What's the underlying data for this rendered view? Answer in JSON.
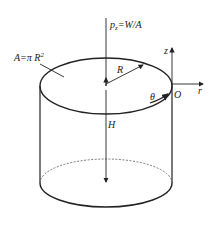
{
  "diagram": {
    "type": "cylinder-pressure",
    "labels": {
      "pressure": "p",
      "pressure_sub": "z",
      "pressure_rhs": "=W/A",
      "area": "A=π R",
      "area_sup": "2",
      "radius": "R",
      "height": "H",
      "angle": "θ",
      "origin": "O",
      "axis_z": "z",
      "axis_r": "r"
    },
    "colors": {
      "stroke": "#222222",
      "background": "#ffffff"
    }
  }
}
